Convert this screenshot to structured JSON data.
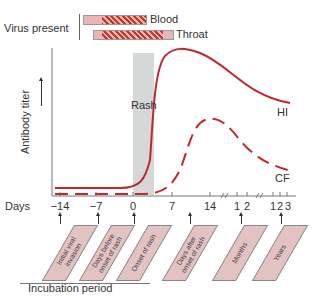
{
  "virus_present": {
    "label": "Virus present",
    "items": [
      {
        "label": "Blood"
      },
      {
        "label": "Throat"
      }
    ]
  },
  "y_axis": {
    "label": "Antibody titer"
  },
  "rash_band": {
    "label": "Rash"
  },
  "x_axis": {
    "prefix": "Days",
    "ticks": [
      "−14",
      "−7",
      "0",
      "7",
      "14",
      "1",
      "2",
      "1",
      "2",
      "3"
    ]
  },
  "curves": [
    {
      "label": "HI",
      "style": "solid",
      "color": "#c0282d"
    },
    {
      "label": "CF",
      "style": "dashed",
      "color": "#c0282d"
    }
  ],
  "stage_tags": [
    {
      "label": "Initial viral invasion"
    },
    {
      "label": "Days before onset of rash"
    },
    {
      "label": "Onset of rash"
    },
    {
      "label": "Days after onset of rash"
    },
    {
      "label": "Months"
    },
    {
      "label": "Years"
    }
  ],
  "incubation": {
    "label": "Incubation period"
  },
  "colors": {
    "curve": "#c0282d",
    "rash_band": "#d5d8d8",
    "tag_fill": "#e3c2c2"
  }
}
